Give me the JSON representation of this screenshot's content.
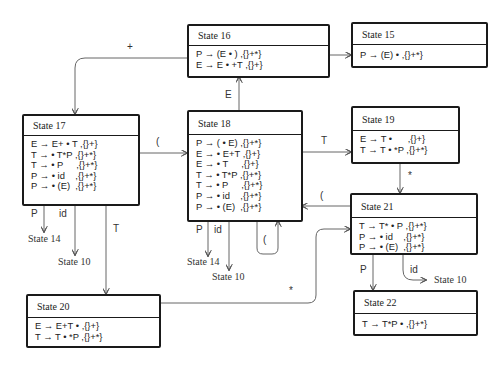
{
  "states": {
    "s15": {
      "title": "State 15",
      "items": [
        {
          "prod": "P → (E) • ",
          "la": ",{}+*}"
        }
      ]
    },
    "s16": {
      "title": "State 16",
      "items": [
        {
          "prod": "P → (E • ) ",
          "la": ",{}+*}"
        },
        {
          "prod": "E → E • +T ",
          "la": ",{}+}"
        }
      ]
    },
    "s17": {
      "title": "State 17",
      "items": [
        {
          "prod": "E → E+ • T ",
          "la": ",{}+}"
        },
        {
          "prod": "T → • T*P ",
          "la": ",{}+*}"
        },
        {
          "prod": "T → • P     ",
          "la": ",{}+*}"
        },
        {
          "prod": "P → • id    ",
          "la": ",{}+*}"
        },
        {
          "prod": "P → • (E)  ",
          "la": ",{}+*}"
        }
      ]
    },
    "s18": {
      "title": "State 18",
      "items": [
        {
          "prod": "P → ( • E) ",
          "la": ",{}+*}"
        },
        {
          "prod": "E → • E+T ",
          "la": ",{}+}"
        },
        {
          "prod": "E → • T     ",
          "la": ",{}+}"
        },
        {
          "prod": "T → • T*P ",
          "la": ",{}+*}"
        },
        {
          "prod": "T → • P     ",
          "la": ",{}+*}"
        },
        {
          "prod": "P → • id    ",
          "la": ",{}+*}"
        },
        {
          "prod": "P → • (E)  ",
          "la": ",{}+*}"
        }
      ]
    },
    "s19": {
      "title": "State 19",
      "items": [
        {
          "prod": "E → T •      ",
          "la": ",{}+}"
        },
        {
          "prod": "T → T • *P ",
          "la": ",{}+*}"
        }
      ]
    },
    "s20": {
      "title": "State 20",
      "items": [
        {
          "prod": "E → E+T • ",
          "la": ",{}+}"
        },
        {
          "prod": "T → T • *P ",
          "la": ",{}+*}"
        }
      ]
    },
    "s21": {
      "title": "State 21",
      "items": [
        {
          "prod": "T → T* • P ",
          "la": ",{}+*}"
        },
        {
          "prod": "P → • id    ",
          "la": ",{}+*}"
        },
        {
          "prod": "P → • (E)  ",
          "la": ",{}+*}"
        }
      ]
    },
    "s22": {
      "title": "State 22",
      "items": [
        {
          "prod": "T → T*P • ",
          "la": ",{}+*}"
        }
      ]
    }
  },
  "edges": {
    "s16_s15": ")",
    "s16_s17": "+",
    "s18_s16": "E",
    "s17_s18": "(",
    "s18_s19": "T",
    "s21_s18": "(",
    "s19_s21": "*",
    "s18_self": "(",
    "s17_P": "P",
    "s17_id": "id",
    "s17_T": "T",
    "s18_P": "P",
    "s18_id": "id",
    "s20_s21": "*",
    "s21_P": "P",
    "s21_id": "id"
  },
  "external_targets": {
    "s17_P": "State 14",
    "s17_id": "State 10",
    "s18_P": "State 14",
    "s18_id": "State 10",
    "s21_id": "State 10"
  },
  "colors": {
    "line": "#555555",
    "border": "#1a1a1a",
    "text": "#222222"
  }
}
